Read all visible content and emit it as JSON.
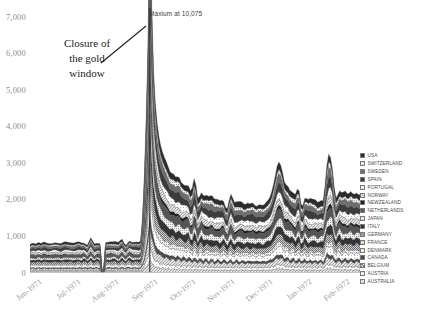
{
  "chart_data": {
    "type": "area",
    "title": "",
    "subtitle": "",
    "xlabel": "",
    "ylabel": "",
    "stacked": true,
    "grid": false,
    "legend_position": "right",
    "ylim": [
      0,
      7000
    ],
    "yticks": [
      "0",
      "1,000",
      "2,000",
      "3,000",
      "4,000",
      "5,000",
      "6,000",
      "7,000"
    ],
    "ytick_values": [
      0,
      1000,
      2000,
      3000,
      4000,
      5000,
      6000,
      7000
    ],
    "xtick_labels": [
      "Jun-1971",
      "Jul-1971",
      "Aug-1971",
      "Sep-1971",
      "Oct-1971",
      "Nov-1971",
      "Dec-1971",
      "Jan-1972",
      "Feb-1972"
    ],
    "annotations": [
      {
        "name": "maximum-callout",
        "text": "Maxium at 10,075",
        "value": 10075
      },
      {
        "name": "closure-callout",
        "line1": "Closure of",
        "line2": "the gold",
        "line3": "window"
      }
    ],
    "series": [
      {
        "name": "USA",
        "swatch": "#2b2b2b",
        "pattern": "solid"
      },
      {
        "name": "SWITZERLAND",
        "swatch": "#d8d8d8",
        "pattern": "fine-dot"
      },
      {
        "name": "SWEDEN",
        "swatch": "#6e6e6e",
        "pattern": "solid"
      },
      {
        "name": "SPAIN",
        "swatch": "#3c3c3c",
        "pattern": "solid"
      },
      {
        "name": "PORTUGAL",
        "swatch": "#eaeaea",
        "pattern": "sparse-dot"
      },
      {
        "name": "NORWAY",
        "swatch": "#bdbdbd",
        "pattern": "hatch"
      },
      {
        "name": "NEWZEALAND",
        "swatch": "#1f1f1f",
        "pattern": "solid"
      },
      {
        "name": "NETHERLANDS",
        "swatch": "#555555",
        "pattern": "solid"
      },
      {
        "name": "JAPAN",
        "swatch": "#cfcfcf",
        "pattern": "fine-dot"
      },
      {
        "name": "ITALY",
        "swatch": "#343434",
        "pattern": "solid"
      },
      {
        "name": "GERMANY",
        "swatch": "#9a9a9a",
        "pattern": "dense-dot"
      },
      {
        "name": "FRANCE",
        "swatch": "#c2c2c2",
        "pattern": "fine-dot"
      },
      {
        "name": "DENMARK",
        "swatch": "#ededed",
        "pattern": "sparse-dot"
      },
      {
        "name": "CANADA",
        "swatch": "#4a4a4a",
        "pattern": "solid"
      },
      {
        "name": "BELGIUM",
        "swatch": "#7f7f7f",
        "pattern": "hatch"
      },
      {
        "name": "AUSTRIA",
        "swatch": "#e2e2e2",
        "pattern": "sparse-dot"
      },
      {
        "name": "AUSTRALIA",
        "swatch": "#d0d0d0",
        "pattern": "hatch"
      }
    ],
    "x": [
      0,
      1,
      2,
      3,
      4,
      5,
      6,
      7,
      8,
      9,
      10,
      11,
      12,
      13,
      14,
      15,
      16,
      17,
      18,
      19,
      20,
      21,
      22,
      23,
      24,
      25,
      26,
      27,
      28,
      29,
      30,
      31,
      32,
      33,
      34,
      35,
      36,
      37,
      38,
      39,
      40,
      41,
      42,
      43,
      44,
      45,
      46,
      47,
      48,
      49,
      50,
      51,
      52,
      53,
      54,
      55,
      56,
      57,
      58,
      59,
      60,
      61,
      62,
      63,
      64,
      65,
      66,
      67,
      68,
      69,
      70,
      71,
      72,
      73,
      74,
      75,
      76,
      77,
      78,
      79,
      80,
      81,
      82,
      83,
      84,
      85,
      86,
      87,
      88,
      89,
      90,
      91,
      92,
      93,
      94,
      95,
      96,
      97,
      98,
      99,
      100,
      101,
      102,
      103,
      104,
      105,
      106,
      107,
      108,
      109,
      110,
      111,
      112,
      113,
      114,
      115,
      116,
      117,
      118,
      119,
      120,
      121,
      122,
      123,
      124,
      125,
      126,
      127,
      128,
      129,
      130,
      131,
      132,
      133,
      134,
      135,
      136,
      137,
      138,
      139,
      140,
      141,
      142,
      143,
      144,
      145,
      146,
      147,
      148,
      149,
      150,
      151,
      152,
      153,
      154,
      155,
      156,
      157,
      158,
      159,
      160,
      161,
      162,
      163,
      164,
      165,
      166,
      167,
      168,
      169,
      170,
      171,
      172,
      173,
      174,
      175,
      176,
      177,
      178,
      179
    ],
    "total": [
      780,
      790,
      800,
      795,
      805,
      810,
      800,
      815,
      820,
      810,
      800,
      795,
      805,
      815,
      820,
      810,
      805,
      800,
      810,
      820,
      830,
      825,
      815,
      805,
      800,
      810,
      820,
      830,
      825,
      815,
      810,
      820,
      830,
      840,
      835,
      825,
      815,
      805,
      800,
      60,
      60,
      820,
      830,
      840,
      850,
      845,
      835,
      825,
      815,
      810,
      820,
      830,
      840,
      850,
      860,
      850,
      840,
      830,
      820,
      815,
      860,
      1450,
      2600,
      4200,
      6100,
      10075,
      7400,
      5600,
      4600,
      4050,
      3700,
      3450,
      3250,
      3100,
      2980,
      2880,
      2800,
      2730,
      2680,
      2640,
      2600,
      2560,
      2520,
      2480,
      2440,
      2400,
      2360,
      2320,
      2290,
      2260,
      2230,
      2200,
      2180,
      2160,
      2140,
      2120,
      2100,
      2080,
      2060,
      2040,
      2020,
      2000,
      1990,
      1980,
      1970,
      1960,
      1950,
      1945,
      1940,
      1935,
      1930,
      1925,
      1920,
      1915,
      1910,
      1905,
      1900,
      1895,
      1890,
      1885,
      1880,
      1875,
      1870,
      1865,
      1860,
      1855,
      1850,
      1860,
      1900,
      1960,
      2050,
      2180,
      2360,
      2600,
      2900,
      3050,
      2900,
      2700,
      2520,
      2400,
      2320,
      2260,
      2210,
      2170,
      2140,
      2110,
      2090,
      2070,
      2050,
      2030,
      2010,
      2000,
      1990,
      1980,
      1975,
      1970,
      1965,
      1960,
      1958,
      1956,
      2300,
      2900,
      3260,
      2950,
      2600,
      2400,
      2300,
      2250,
      2220,
      2200,
      2190,
      2180,
      2175,
      2170,
      2168,
      2166,
      2164,
      2162,
      2160,
      2158
    ]
  }
}
